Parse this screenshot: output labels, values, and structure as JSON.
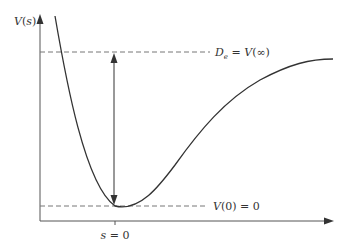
{
  "figure": {
    "type": "potential-energy-curve",
    "y_axis_label": {
      "name": "V",
      "arg": "s",
      "open": "(",
      "close": ")"
    },
    "x_tick_label": {
      "var": "s",
      "eq": " = ",
      "val": "0"
    },
    "dissociation_label": {
      "D": "D",
      "sub": "e",
      "eq": " = ",
      "V": "V",
      "arg": "(∞)"
    },
    "minimum_label": {
      "V": "V",
      "arg": "(0)",
      "eq": " = ",
      "val": "0"
    }
  },
  "colors": {
    "curve": "#333333",
    "axis": "#555555",
    "dashed": "#777777",
    "text": "#333333"
  }
}
